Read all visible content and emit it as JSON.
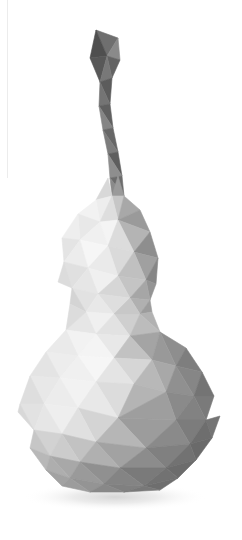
{
  "canvas": {
    "width": 242,
    "height": 540,
    "background_color": "#ffffff",
    "title": "Low-poly gourd 3D render"
  },
  "artwork": {
    "subject_name": "low-poly-gourd",
    "description": "Faceted polygonal gourd (calabash) with curved stem",
    "style": "low-poly triangulated shading",
    "light_direction": "upper-left",
    "alt_text": "Grayscale low-poly gourd with a bent dark stem and soft drop shadow"
  },
  "palette": {
    "background": "#ffffff",
    "highlight": "#fafafa",
    "light": "#f0f0f0",
    "light_mid": "#e2e2e2",
    "mid": "#c8c8c8",
    "mid_dark": "#aaaaaa",
    "dark": "#8c8c8c",
    "darker": "#767676",
    "darkest": "#5e5e5e",
    "stem_dark": "#555555",
    "stem_mid": "#7f7f7f",
    "shadow": "#e4e4e4",
    "artifact_line": "#ececec"
  },
  "geometry": {
    "stem": {
      "name": "gourd-stem",
      "top_y": 30,
      "bottom_y": 195,
      "left_x": 88,
      "right_x": 130
    },
    "upper_bulb": {
      "name": "gourd-upper-bulb",
      "top_y": 175,
      "bottom_y": 305,
      "left_x": 55,
      "right_x": 163,
      "center_x": 108
    },
    "waist": {
      "name": "gourd-waist",
      "y": 312,
      "left_x": 86,
      "right_x": 150
    },
    "lower_bulb": {
      "name": "gourd-lower-bulb",
      "top_y": 305,
      "bottom_y": 492,
      "left_x": 18,
      "right_x": 220,
      "center_x": 118,
      "center_y": 418
    },
    "shadow": {
      "name": "drop-shadow",
      "center_x": 115,
      "center_y": 497,
      "radius_x": 92,
      "radius_y": 14
    },
    "artifact": {
      "name": "edge-artifact-line",
      "x": 7,
      "top_y": 0,
      "bottom_y": 178
    }
  },
  "facets": {
    "stem": [
      {
        "points": "96,30 118,38 107,56",
        "fill": "#6f6f6f"
      },
      {
        "points": "96,30 107,56 90,58",
        "fill": "#4f4f4f"
      },
      {
        "points": "118,38 120,60 107,56",
        "fill": "#8a8a8a"
      },
      {
        "points": "107,56 120,60 112,78",
        "fill": "#636363"
      },
      {
        "points": "90,58 107,56 100,82",
        "fill": "#585858"
      },
      {
        "points": "107,56 112,78 100,82",
        "fill": "#787878"
      },
      {
        "points": "100,82 112,78 110,104",
        "fill": "#5c5c5c"
      },
      {
        "points": "100,82 110,104 99,106",
        "fill": "#747474"
      },
      {
        "points": "99,106 110,104 113,128",
        "fill": "#606060"
      },
      {
        "points": "99,106 113,128 103,130",
        "fill": "#858585"
      },
      {
        "points": "103,130 113,128 118,152",
        "fill": "#676767"
      },
      {
        "points": "103,130 118,152 108,154",
        "fill": "#7d7d7d"
      },
      {
        "points": "108,154 118,152 122,176",
        "fill": "#5e5e5e"
      },
      {
        "points": "108,154 122,176 110,178",
        "fill": "#8e8e8e"
      },
      {
        "points": "110,178 122,176 124,196",
        "fill": "#6c6c6c"
      },
      {
        "points": "110,178 124,196 112,196",
        "fill": "#8a8a8a"
      }
    ],
    "upper_bulb": [
      {
        "points": "112,196 124,196 118,176",
        "fill": "#9a9a9a"
      },
      {
        "points": "108,178 112,196 96,200",
        "fill": "#d8d8d8"
      },
      {
        "points": "96,200 112,196 100,222",
        "fill": "#ededed"
      },
      {
        "points": "112,196 124,196 118,220",
        "fill": "#c6c6c6"
      },
      {
        "points": "112,196 118,220 100,222",
        "fill": "#dedede"
      },
      {
        "points": "124,196 140,210 118,220",
        "fill": "#a8a8a8"
      },
      {
        "points": "140,210 150,232 118,220",
        "fill": "#9a9a9a"
      },
      {
        "points": "96,200 100,222 78,214",
        "fill": "#f2f2f2"
      },
      {
        "points": "78,214 100,222 80,240",
        "fill": "#e8e8e8"
      },
      {
        "points": "100,222 118,220 108,246",
        "fill": "#f4f4f4"
      },
      {
        "points": "100,222 108,246 80,240",
        "fill": "#f0f0f0"
      },
      {
        "points": "118,220 150,232 134,252",
        "fill": "#b4b4b4"
      },
      {
        "points": "118,220 134,252 108,246",
        "fill": "#dcdcdc"
      },
      {
        "points": "150,232 158,258 134,252",
        "fill": "#8e8e8e"
      },
      {
        "points": "78,214 80,240 62,238",
        "fill": "#eeeeee"
      },
      {
        "points": "62,238 80,240 64,262",
        "fill": "#e4e4e4"
      },
      {
        "points": "80,240 108,246 88,268",
        "fill": "#f6f6f6"
      },
      {
        "points": "80,240 88,268 64,262",
        "fill": "#ececec"
      },
      {
        "points": "108,246 134,252 118,276",
        "fill": "#dadada"
      },
      {
        "points": "108,246 118,276 88,268",
        "fill": "#eaeaea"
      },
      {
        "points": "134,252 158,258 146,280",
        "fill": "#a0a0a0"
      },
      {
        "points": "134,252 146,280 118,276",
        "fill": "#c0c0c0"
      },
      {
        "points": "158,258 156,284 146,280",
        "fill": "#868686"
      },
      {
        "points": "64,262 88,268 72,288",
        "fill": "#e0e0e0"
      },
      {
        "points": "64,262 72,288 58,282",
        "fill": "#dcdcdc"
      },
      {
        "points": "88,268 118,276 98,294",
        "fill": "#f0f0f0"
      },
      {
        "points": "88,268 98,294 72,288",
        "fill": "#e6e6e6"
      },
      {
        "points": "118,276 146,280 130,298",
        "fill": "#c4c4c4"
      },
      {
        "points": "118,276 130,298 98,294",
        "fill": "#d6d6d6"
      },
      {
        "points": "146,280 156,284 150,300",
        "fill": "#949494"
      },
      {
        "points": "146,280 150,300 130,298",
        "fill": "#a6a6a6"
      },
      {
        "points": "72,288 98,294 86,312",
        "fill": "#e2e2e2"
      },
      {
        "points": "72,288 86,312 70,304",
        "fill": "#d4d4d4"
      },
      {
        "points": "98,294 130,298 114,314",
        "fill": "#dedede"
      },
      {
        "points": "98,294 114,314 86,312",
        "fill": "#e8e8e8"
      },
      {
        "points": "130,298 150,300 140,314",
        "fill": "#b0b0b0"
      },
      {
        "points": "130,298 140,314 114,314",
        "fill": "#c8c8c8"
      },
      {
        "points": "150,300 152,312 140,314",
        "fill": "#9c9c9c"
      }
    ],
    "lower_bulb": [
      {
        "points": "86,312 114,314 96,334",
        "fill": "#f0f0f0"
      },
      {
        "points": "86,312 96,334 66,330",
        "fill": "#e6e6e6"
      },
      {
        "points": "114,314 140,314 130,336",
        "fill": "#cfcfcf"
      },
      {
        "points": "114,314 130,336 96,334",
        "fill": "#e2e2e2"
      },
      {
        "points": "140,314 152,312 160,332",
        "fill": "#b2b2b2"
      },
      {
        "points": "140,314 160,332 130,336",
        "fill": "#bcbcbc"
      },
      {
        "points": "70,304 86,312 66,330",
        "fill": "#dcdcdc"
      },
      {
        "points": "66,330 96,334 78,356",
        "fill": "#f2f2f2"
      },
      {
        "points": "66,330 78,356 46,352",
        "fill": "#eaeaea"
      },
      {
        "points": "96,334 130,336 114,358",
        "fill": "#e8e8e8"
      },
      {
        "points": "96,334 114,358 78,356",
        "fill": "#f4f4f4"
      },
      {
        "points": "130,336 160,332 152,360",
        "fill": "#a4a4a4"
      },
      {
        "points": "130,336 152,360 114,358",
        "fill": "#c2c2c2"
      },
      {
        "points": "160,332 186,348 176,366",
        "fill": "#8e8e8e"
      },
      {
        "points": "160,332 176,366 152,360",
        "fill": "#999999"
      },
      {
        "points": "186,348 202,372 176,366",
        "fill": "#7e7e7e"
      },
      {
        "points": "46,352 78,356 60,378",
        "fill": "#ededed"
      },
      {
        "points": "46,352 60,378 30,376",
        "fill": "#e4e4e4"
      },
      {
        "points": "78,356 114,358 96,382",
        "fill": "#f6f6f6"
      },
      {
        "points": "78,356 96,382 60,378",
        "fill": "#f0f0f0"
      },
      {
        "points": "114,358 152,360 134,384",
        "fill": "#d6d6d6"
      },
      {
        "points": "114,358 134,384 96,382",
        "fill": "#e4e4e4"
      },
      {
        "points": "152,360 176,366 166,392",
        "fill": "#a8a8a8"
      },
      {
        "points": "152,360 166,392 134,384",
        "fill": "#b8b8b8"
      },
      {
        "points": "176,366 202,372 194,396",
        "fill": "#868686"
      },
      {
        "points": "176,366 194,396 166,392",
        "fill": "#909090"
      },
      {
        "points": "202,372 214,396 194,396",
        "fill": "#747474"
      },
      {
        "points": "30,376 60,378 44,404",
        "fill": "#e8e8e8"
      },
      {
        "points": "30,376 44,404 20,404",
        "fill": "#dedede"
      },
      {
        "points": "60,378 96,382 78,408",
        "fill": "#f2f2f2"
      },
      {
        "points": "60,378 78,408 44,404",
        "fill": "#ececec"
      },
      {
        "points": "96,382 134,384 118,418",
        "fill": "#dcdcdc"
      },
      {
        "points": "96,382 118,418 78,408",
        "fill": "#e8e8e8"
      },
      {
        "points": "134,384 166,392 118,418",
        "fill": "#b4b4b4"
      },
      {
        "points": "166,392 194,396 176,420",
        "fill": "#8a8a8a"
      },
      {
        "points": "166,392 176,420 118,418",
        "fill": "#9e9e9e"
      },
      {
        "points": "194,396 214,396 206,420",
        "fill": "#7a7a7a"
      },
      {
        "points": "194,396 206,420 176,420",
        "fill": "#828282"
      },
      {
        "points": "20,404 44,404 34,430",
        "fill": "#e2e2e2"
      },
      {
        "points": "18,412 20,404 34,430",
        "fill": "#d8d8d8"
      },
      {
        "points": "44,404 78,408 62,434",
        "fill": "#eeeeee"
      },
      {
        "points": "44,404 62,434 34,430",
        "fill": "#e6e6e6"
      },
      {
        "points": "78,408 118,418 96,442",
        "fill": "#d4d4d4"
      },
      {
        "points": "78,408 96,442 62,434",
        "fill": "#e0e0e0"
      },
      {
        "points": "118,418 176,420 146,448",
        "fill": "#9c9c9c"
      },
      {
        "points": "118,418 146,448 96,442",
        "fill": "#b6b6b6"
      },
      {
        "points": "176,420 206,420 190,444",
        "fill": "#7c7c7c"
      },
      {
        "points": "176,420 190,444 146,448",
        "fill": "#8a8a8a"
      },
      {
        "points": "206,420 220,416 212,438",
        "fill": "#747474"
      },
      {
        "points": "206,420 212,438 190,444",
        "fill": "#6e6e6e"
      },
      {
        "points": "34,430 62,434 50,456",
        "fill": "#d2d2d2"
      },
      {
        "points": "34,430 50,456 30,448",
        "fill": "#c6c6c6"
      },
      {
        "points": "62,434 96,442 80,462",
        "fill": "#c2c2c2"
      },
      {
        "points": "62,434 80,462 50,456",
        "fill": "#cccccc"
      },
      {
        "points": "96,442 146,448 120,468",
        "fill": "#a2a2a2"
      },
      {
        "points": "96,442 120,468 80,462",
        "fill": "#b0b0b0"
      },
      {
        "points": "146,448 190,444 166,468",
        "fill": "#808080"
      },
      {
        "points": "146,448 166,468 120,468",
        "fill": "#8c8c8c"
      },
      {
        "points": "190,444 212,438 196,460",
        "fill": "#6a6a6a"
      },
      {
        "points": "190,444 196,460 166,468",
        "fill": "#727272"
      },
      {
        "points": "30,448 50,456 46,470",
        "fill": "#b8b8b8"
      },
      {
        "points": "50,456 80,462 70,478",
        "fill": "#a8a8a8"
      },
      {
        "points": "50,456 70,478 46,470",
        "fill": "#aeaeae"
      },
      {
        "points": "80,462 120,468 104,484",
        "fill": "#909090"
      },
      {
        "points": "80,462 104,484 70,478",
        "fill": "#9a9a9a"
      },
      {
        "points": "120,468 166,468 144,486",
        "fill": "#7a7a7a"
      },
      {
        "points": "120,468 144,486 104,484",
        "fill": "#848484"
      },
      {
        "points": "166,468 196,460 178,478",
        "fill": "#6c6c6c"
      },
      {
        "points": "166,468 178,478 144,486",
        "fill": "#727272"
      },
      {
        "points": "46,470 70,478 62,486",
        "fill": "#a2a2a2"
      },
      {
        "points": "70,478 104,484 90,492",
        "fill": "#949494"
      },
      {
        "points": "70,478 90,492 62,486",
        "fill": "#9c9c9c"
      },
      {
        "points": "104,484 144,486 124,492",
        "fill": "#808080"
      },
      {
        "points": "104,484 124,492 90,492",
        "fill": "#888888"
      },
      {
        "points": "144,486 178,478 160,490",
        "fill": "#6e6e6e"
      },
      {
        "points": "144,486 160,490 124,492",
        "fill": "#787878"
      }
    ]
  }
}
